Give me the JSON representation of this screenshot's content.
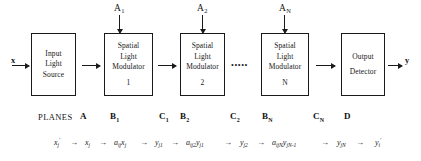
{
  "figure": {
    "ellipsis": "•••••"
  },
  "io": {
    "input_vector": "x",
    "output_vector": "y"
  },
  "control_labels": [
    {
      "name": "A-1",
      "base": "A",
      "sub": "1"
    },
    {
      "name": "A-2",
      "base": "A",
      "sub": "2"
    },
    {
      "name": "A-N",
      "base": "A",
      "sub": "N"
    }
  ],
  "blocks": [
    {
      "id": "input-light-source",
      "lines": [
        "Input",
        "Light",
        "Source"
      ],
      "index": ""
    },
    {
      "id": "slm-1",
      "lines": [
        "Spatial",
        "Light",
        "Modulator"
      ],
      "index": "1"
    },
    {
      "id": "slm-2",
      "lines": [
        "Spatial",
        "Light",
        "Modulator"
      ],
      "index": "2"
    },
    {
      "id": "slm-n",
      "lines": [
        "Spatial",
        "Light",
        "Modulator"
      ],
      "index": "N"
    },
    {
      "id": "output-detector",
      "lines": [
        "Output",
        "Detector"
      ],
      "index": ""
    }
  ],
  "planes": {
    "label": "PLANES",
    "items": [
      {
        "base": "A",
        "sub": ""
      },
      {
        "base": "B",
        "sub": "1"
      },
      {
        "base": "C",
        "sub": "1"
      },
      {
        "base": "B",
        "sub": "2"
      },
      {
        "base": "C",
        "sub": "2"
      },
      {
        "base": "B",
        "sub": "N"
      },
      {
        "base": "C",
        "sub": "N"
      },
      {
        "base": "D",
        "sub": ""
      }
    ]
  },
  "chain": {
    "arrow": "→",
    "terms": [
      {
        "main": "x",
        "sub": "j",
        "sup": "'"
      },
      {
        "main": "x",
        "sub": "j",
        "sup": ""
      },
      {
        "main": "a",
        "sub": "ij",
        "sup": "",
        "suffix_main": "x",
        "suffix_sub": "j"
      },
      {
        "main": "y",
        "sub": "j1",
        "sup": ""
      },
      {
        "main": "a",
        "sub": "ij2",
        "sup": "",
        "suffix_main": "y",
        "suffix_sub": "j1"
      },
      {
        "main": "y",
        "sub": "j2",
        "sup": ""
      },
      {
        "main": "a",
        "sub": "ijN",
        "sup": "",
        "suffix_main": "y",
        "suffix_sub": "jN-1"
      },
      {
        "main": "y",
        "sub": "jN",
        "sup": ""
      },
      {
        "main": "y",
        "sub": "i",
        "sup": "'"
      }
    ]
  }
}
